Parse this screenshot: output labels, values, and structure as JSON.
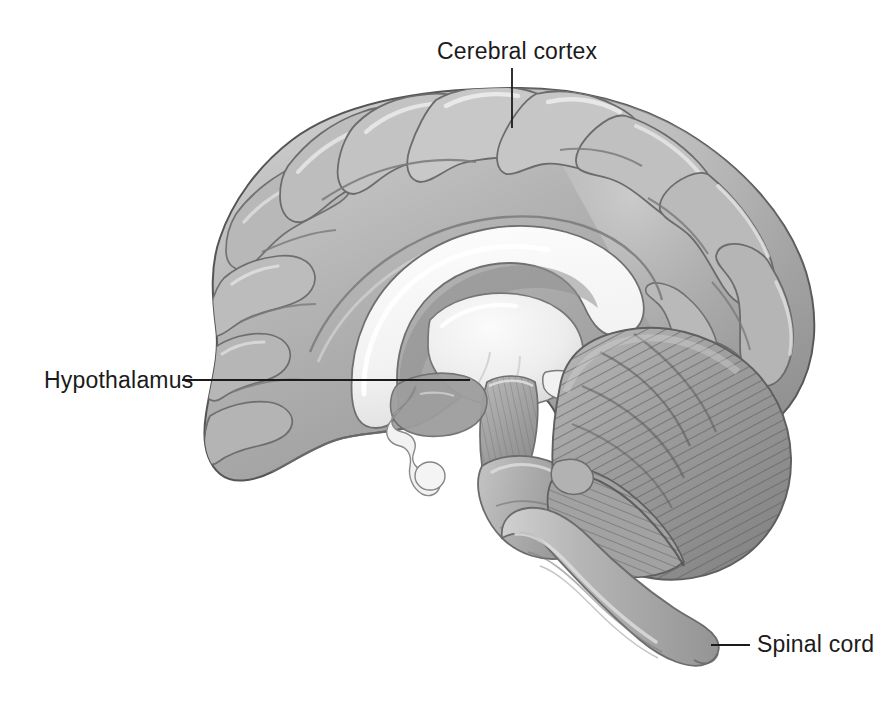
{
  "figure": {
    "background_color": "#ffffff",
    "width": 884,
    "height": 720
  },
  "labels": [
    {
      "id": "cerebral-cortex",
      "text": "Cerebral cortex",
      "x": 437,
      "y": 40,
      "leader": {
        "type": "vertical",
        "x1": 512,
        "y1": 68,
        "x2": 512,
        "y2": 128
      }
    },
    {
      "id": "hypothalamus",
      "text": "Hypothalamus",
      "x": 44,
      "y": 369,
      "leader": {
        "type": "horizontal",
        "x1": 182,
        "y1": 380,
        "x2": 470,
        "y2": 380
      }
    },
    {
      "id": "spinal-cord",
      "text": "Spinal cord",
      "x": 757,
      "y": 633,
      "leader": {
        "type": "horizontal",
        "x1": 711,
        "y1": 645,
        "x2": 750,
        "y2": 645
      }
    }
  ],
  "structures": [
    {
      "name": "cerebral-cortex",
      "description": "Folded gray cortical mantle with gyri and sulci",
      "fill": "#a9a9a9"
    },
    {
      "name": "corpus-callosum",
      "description": "Arched white band above the thalamus",
      "fill": "#f6f6f6"
    },
    {
      "name": "thalamus",
      "description": "Light ovoid mass in the center of the section",
      "fill": "#ececec"
    },
    {
      "name": "hypothalamus",
      "description": "Region below the thalamus, anterior to the midbrain",
      "fill": "#9a9a9a"
    },
    {
      "name": "pituitary-stalk",
      "description": "Light zigzag stalk descending from hypothalamus",
      "fill": "#f2f2f2"
    },
    {
      "name": "midbrain",
      "description": "Striated midbrain between thalamus and pons",
      "fill": "#9e9e9e"
    },
    {
      "name": "pons",
      "description": "Bulging brainstem segment anterior to cerebellum",
      "fill": "#a0a0a0"
    },
    {
      "name": "cerebellum",
      "description": "Striated hemisphere with radiating folia, posterior-inferior",
      "fill": "#999999"
    },
    {
      "name": "medulla-and-spinal-cord",
      "description": "Tapering cord descending below the brainstem",
      "fill": "#b0b0b0"
    }
  ],
  "palette": {
    "cortex_mid": "#a9a9a9",
    "cortex_light": "#d2d2d2",
    "cortex_highlight": "#e8e8e8",
    "sulcus_dark": "#6f6f6f",
    "outline": "#4a4a4a",
    "white_matter": "#f6f6f6",
    "cerebellum_fold": "#6a6a6a",
    "label_text": "#1b1b1b",
    "leader_line": "#1b1b1b",
    "background": "#ffffff"
  }
}
